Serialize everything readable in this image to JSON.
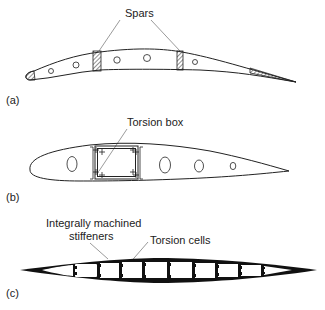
{
  "figure": {
    "panels": [
      {
        "id": "a",
        "label": "(a)",
        "annotations": [
          {
            "text": "Spars"
          }
        ]
      },
      {
        "id": "b",
        "label": "(b)",
        "annotations": [
          {
            "text": "Torsion box"
          }
        ]
      },
      {
        "id": "c",
        "label": "(c)",
        "annotations": [
          {
            "text_line1": "Integrally machined",
            "text_line2": "stiffeners"
          },
          {
            "text": "Torsion cells"
          }
        ]
      }
    ],
    "colors": {
      "stroke": "#222222",
      "fill_solid": "#111111",
      "background": "#ffffff"
    }
  }
}
